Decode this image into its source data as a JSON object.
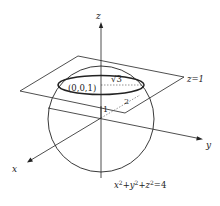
{
  "diagram": {
    "type": "3d-sphere-plane-intersection",
    "axes": {
      "x_label": "x",
      "y_label": "y",
      "z_label": "z"
    },
    "plane_label": "z=1",
    "center_label": "(0,0,1)",
    "radius_label": "√3",
    "height_label": "1",
    "sphere_radius_label": "2",
    "equation": {
      "x": "x",
      "y": "y",
      "z": "z",
      "exp": "2",
      "plus": "+",
      "rhs": "=4"
    },
    "colors": {
      "stroke": "#222222",
      "dotted": "#666666",
      "background": "#ffffff"
    }
  }
}
